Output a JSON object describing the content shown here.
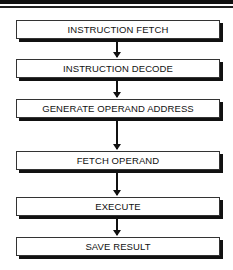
{
  "diagram": {
    "type": "flowchart",
    "direction": "top-to-bottom",
    "steps": [
      {
        "label": "INSTRUCTION FETCH"
      },
      {
        "label": "INSTRUCTION DECODE"
      },
      {
        "label": "GENERATE OPERAND ADDRESS"
      },
      {
        "label": "FETCH OPERAND"
      },
      {
        "label": "EXECUTE"
      },
      {
        "label": "SAVE RESULT"
      }
    ],
    "colors": {
      "line": "#111111",
      "box_fill": "#ffffff",
      "background": "#ffffff"
    }
  }
}
